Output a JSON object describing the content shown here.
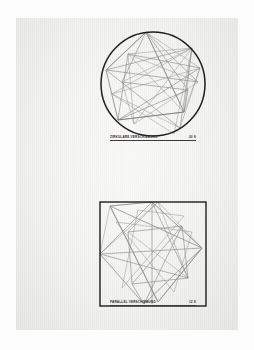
{
  "sheet": {
    "medium": "paper",
    "background_color": "#f2f2f0",
    "ink_color": "#3a3a3a",
    "thin_line_color": "#8d8d8d"
  },
  "figures": [
    {
      "id": "circle-figure",
      "frame_shape": "circle",
      "caption_title": "ZIRKULÄRE VERSCHIEBUNG",
      "caption_value": "20 S",
      "stroke_color": "#1f1f1f",
      "construction_lines": 28
    },
    {
      "id": "square-figure",
      "frame_shape": "square",
      "caption_title": "PARALLEL VERSCHIEBUNG",
      "caption_value": "12 S",
      "stroke_color": "#1f1f1f",
      "construction_lines": 30
    }
  ],
  "chart_data": {
    "type": "line",
    "xlabel": "",
    "ylabel": "",
    "panels": [
      {
        "name": "ZIRKULÄRE VERSCHIEBUNG",
        "boundary": "circle",
        "center": [
          65,
          60
        ],
        "radius": 52,
        "polylines": [
          [
            [
              58,
              8
            ],
            [
              18,
              46
            ],
            [
              30,
              96
            ],
            [
              96,
              88
            ],
            [
              58,
              8
            ]
          ],
          [
            [
              58,
              8
            ],
            [
              96,
              88
            ],
            [
              112,
              44
            ],
            [
              58,
              8
            ]
          ],
          [
            [
              40,
              30
            ],
            [
              104,
              24
            ],
            [
              96,
              88
            ],
            [
              40,
              30
            ]
          ],
          [
            [
              18,
              46
            ],
            [
              104,
              24
            ],
            [
              92,
              104
            ],
            [
              18,
              46
            ]
          ],
          [
            [
              30,
              96
            ],
            [
              112,
              44
            ],
            [
              40,
              30
            ],
            [
              30,
              96
            ]
          ],
          [
            [
              24,
              70
            ],
            [
              86,
              110
            ],
            [
              104,
              24
            ],
            [
              24,
              70
            ]
          ],
          [
            [
              34,
              58
            ],
            [
              100,
              66
            ],
            [
              58,
              8
            ],
            [
              34,
              58
            ]
          ],
          [
            [
              46,
              100
            ],
            [
              110,
              58
            ],
            [
              40,
              30
            ],
            [
              46,
              100
            ]
          ],
          [
            [
              30,
              96
            ],
            [
              96,
              88
            ],
            [
              100,
              66
            ],
            [
              30,
              96
            ]
          ],
          [
            [
              18,
              46
            ],
            [
              58,
              8
            ],
            [
              110,
              58
            ],
            [
              18,
              46
            ]
          ],
          [
            [
              34,
              58
            ],
            [
              46,
              100
            ],
            [
              104,
              24
            ],
            [
              34,
              58
            ]
          ],
          [
            [
              24,
              70
            ],
            [
              92,
              104
            ],
            [
              112,
              44
            ],
            [
              24,
              70
            ]
          ]
        ]
      },
      {
        "name": "PARALLEL VERSCHIEBUNG",
        "boundary": "square",
        "rect": [
          12,
          10,
          106,
          104
        ],
        "polylines": [
          [
            [
              22,
              14
            ],
            [
              64,
              10
            ],
            [
              114,
              56
            ],
            [
              70,
              110
            ],
            [
              22,
              14
            ]
          ],
          [
            [
              12,
              62
            ],
            [
              70,
              10
            ],
            [
              114,
              56
            ],
            [
              56,
              112
            ],
            [
              12,
              62
            ]
          ],
          [
            [
              22,
              14
            ],
            [
              114,
              56
            ],
            [
              56,
              112
            ],
            [
              12,
              62
            ],
            [
              22,
              14
            ]
          ],
          [
            [
              40,
              40
            ],
            [
              94,
              34
            ],
            [
              100,
              86
            ],
            [
              44,
              92
            ],
            [
              40,
              40
            ]
          ],
          [
            [
              12,
              62
            ],
            [
              64,
              10
            ],
            [
              100,
              86
            ],
            [
              12,
              62
            ]
          ],
          [
            [
              22,
              14
            ],
            [
              70,
              110
            ],
            [
              114,
              56
            ],
            [
              22,
              14
            ]
          ],
          [
            [
              44,
              92
            ],
            [
              94,
              34
            ],
            [
              56,
              112
            ],
            [
              44,
              92
            ]
          ],
          [
            [
              40,
              40
            ],
            [
              100,
              86
            ],
            [
              70,
              10
            ],
            [
              40,
              40
            ]
          ],
          [
            [
              64,
              10
            ],
            [
              64,
              112
            ]
          ],
          [
            [
              12,
              62
            ],
            [
              114,
              56
            ]
          ],
          [
            [
              28,
              30
            ],
            [
              86,
              100
            ],
            [
              104,
              40
            ],
            [
              28,
              30
            ]
          ],
          [
            [
              34,
              96
            ],
            [
              96,
              24
            ],
            [
              50,
              18
            ],
            [
              34,
              96
            ]
          ]
        ]
      }
    ]
  }
}
